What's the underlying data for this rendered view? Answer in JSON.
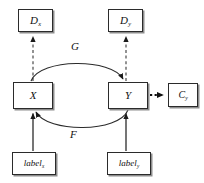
{
  "diagram": {
    "stroke_color": "#2b2b2b",
    "shadow_color": "#8d8d8d",
    "background": "#ffffff",
    "nodes": {
      "discriminator_x": {
        "name": "D",
        "subscript": "x"
      },
      "discriminator_y": {
        "name": "D",
        "subscript": "y"
      },
      "domain_x": {
        "name": "X",
        "subscript": ""
      },
      "domain_y": {
        "name": "Y",
        "subscript": ""
      },
      "classifier_y": {
        "name": "C",
        "subscript": "y"
      },
      "label_x": {
        "name": "label",
        "subscript": "x"
      },
      "label_y": {
        "name": "label",
        "subscript": "y"
      }
    },
    "edges": {
      "generator_g": {
        "label": "G",
        "from": "X",
        "to": "Y",
        "style": "solid-curve-top"
      },
      "generator_f": {
        "label": "F",
        "from": "Y",
        "to": "X",
        "style": "solid-curve-bottom"
      },
      "x_to_dx": {
        "label": "",
        "from": "X",
        "to": "D_x",
        "style": "dashed-up"
      },
      "y_to_dy": {
        "label": "",
        "from": "Y",
        "to": "D_y",
        "style": "dashed-up"
      },
      "labelx_to_x": {
        "label": "",
        "from": "label_x",
        "to": "X",
        "style": "solid-up"
      },
      "labely_to_y": {
        "label": "",
        "from": "label_y",
        "to": "Y",
        "style": "solid-up"
      },
      "y_to_cy": {
        "label": "",
        "from": "Y",
        "to": "C_y",
        "style": "dotted-right"
      }
    }
  }
}
